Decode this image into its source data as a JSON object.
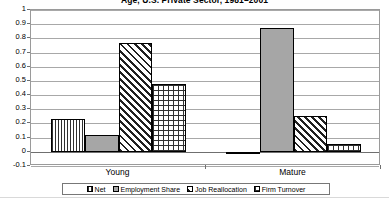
{
  "chart_data": {
    "type": "bar",
    "title": "Age, U.S. Private Sector, 1981–2001",
    "xlabel": "",
    "ylabel": "",
    "ylim": [
      -0.1,
      1.0
    ],
    "ytick_step": 0.1,
    "grid": true,
    "legend_position": "bottom",
    "categories": [
      "Young",
      "Mature"
    ],
    "yticks": [
      "1",
      "0.9",
      "0.8",
      "0.7",
      "0.6",
      "0.5",
      "0.4",
      "0.3",
      "0.2",
      "0.1",
      "0",
      "-0.1"
    ],
    "series": [
      {
        "name": "Net",
        "pattern": "vertical-hatch",
        "values": [
          0.23,
          -0.01
        ]
      },
      {
        "name": "Employment Share",
        "pattern": "solid-gray",
        "values": [
          0.12,
          0.875
        ]
      },
      {
        "name": "Job Reallocation",
        "pattern": "diagonal-hatch",
        "values": [
          0.765,
          0.25
        ]
      },
      {
        "name": "Firm Turnover",
        "pattern": "crosshatch-grid",
        "values": [
          0.48,
          0.055
        ]
      }
    ]
  },
  "legend": {
    "items": [
      {
        "label": "Net"
      },
      {
        "label": "Employment Share"
      },
      {
        "label": "Job Reallocation"
      },
      {
        "label": "Firm Turnover"
      }
    ]
  },
  "colors": {
    "solid_fill": "#a6a6a6",
    "hatch_stroke": "#303030",
    "gridline": "#a8a8a8",
    "axis": "#6f6f6f",
    "bar_outline": "#000000"
  }
}
